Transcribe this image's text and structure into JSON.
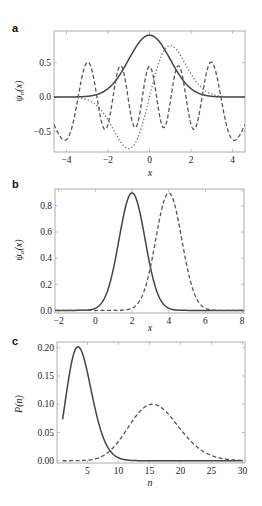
{
  "chart_data": [
    {
      "panel": "a",
      "type": "line",
      "xlabel": "x",
      "ylabel": "ψn(x)",
      "xlim": [
        -4.6,
        4.6
      ],
      "ylim": [
        -0.8,
        0.96
      ],
      "xticks": [
        -4,
        -2,
        0,
        2,
        4
      ],
      "xtick_labels": [
        "−4",
        "−2",
        "0",
        "2",
        "4"
      ],
      "yticks": [
        0.5,
        0.0,
        -0.5
      ],
      "ytick_labels": [
        "0.5",
        "0.0",
        "−0.5"
      ],
      "series": [
        {
          "name": "n=0 (solid)",
          "style": "solid",
          "kind": "hermite",
          "n": 0,
          "scale": 0.9
        },
        {
          "name": "n=1 (dotted)",
          "style": "dotted",
          "kind": "hermite",
          "n": 1,
          "scale": 0.75
        },
        {
          "name": "n=10 (dashed)",
          "style": "dashed",
          "kind": "hermite",
          "n": 10,
          "scale": -0.63
        }
      ],
      "annotations": {
        "peak_solid": [
          0,
          0.9
        ],
        "dotted_extrema": [
          [
            -0.8,
            -0.75
          ],
          [
            0.8,
            0.75
          ]
        ],
        "dashed_outer_peaks": [
          [
            -3.0,
            0.63
          ],
          [
            2.9,
            0.63
          ]
        ]
      }
    },
    {
      "panel": "b",
      "type": "line",
      "xlabel": "x",
      "ylabel": "ψα(x)",
      "xlim": [
        -2.2,
        8.1
      ],
      "ylim": [
        -0.02,
        0.93
      ],
      "xticks": [
        -2,
        0,
        2,
        4,
        6,
        8
      ],
      "xtick_labels": [
        "−2",
        "0",
        "2",
        "4",
        "6",
        "8"
      ],
      "yticks": [
        0.0,
        0.2,
        0.4,
        0.6,
        0.8
      ],
      "ytick_labels": [
        "0.0",
        "0.2",
        "0.4",
        "0.6",
        "0.8"
      ],
      "series": [
        {
          "name": "center 2 (solid)",
          "style": "solid",
          "kind": "gaussian",
          "center": 2,
          "peak": 0.9,
          "width": 1.0
        },
        {
          "name": "center 4 (dashed)",
          "style": "dashed",
          "kind": "gaussian",
          "center": 4,
          "peak": 0.9,
          "width": 1.0
        }
      ]
    },
    {
      "panel": "c",
      "type": "line",
      "xlabel": "n",
      "ylabel": "P(n)",
      "xlim": [
        0.1,
        30.4
      ],
      "ylim": [
        -0.004,
        0.21
      ],
      "xticks": [
        5,
        10,
        15,
        20,
        25,
        30
      ],
      "xtick_labels": [
        "5",
        "10",
        "15",
        "20",
        "25",
        "30"
      ],
      "yticks": [
        0.0,
        0.05,
        0.1,
        0.15,
        0.2
      ],
      "ytick_labels": [
        "0.00",
        "0.05",
        "0.10",
        "0.15",
        "0.20"
      ],
      "series": [
        {
          "name": "Poisson mean 4 (solid)",
          "style": "solid",
          "kind": "poisson",
          "mean": 4,
          "from": 1,
          "to": 30
        },
        {
          "name": "Poisson mean 16 (dashed)",
          "style": "dashed",
          "kind": "poisson",
          "mean": 16,
          "from": 1,
          "to": 30
        }
      ]
    }
  ],
  "panels": {
    "a": {
      "letter": "a",
      "xlabel": "x",
      "ylabel_main": "ψ",
      "ylabel_sub": "n",
      "ylabel_tail": "(x)"
    },
    "b": {
      "letter": "b",
      "xlabel": "x",
      "ylabel_main": "ψ",
      "ylabel_sub": "α",
      "ylabel_tail": "(x)"
    },
    "c": {
      "letter": "c",
      "xlabel": "n",
      "ylabel_main": "P(n)"
    }
  }
}
